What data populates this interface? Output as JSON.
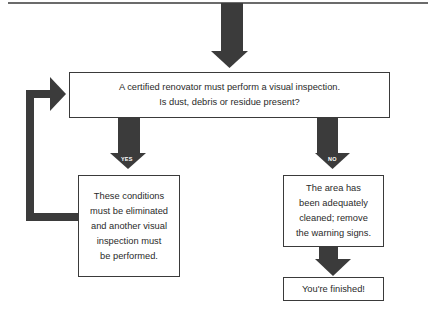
{
  "diagram": {
    "type": "flowchart",
    "colors": {
      "arrow": "#3b3b3b",
      "border": "#3a3a3a",
      "text": "#2a2a2a",
      "background": "#ffffff"
    },
    "nodes": {
      "inspection": {
        "line1": "A certified renovator must perform a visual inspection.",
        "line2": "Is dust, debris or residue present?"
      },
      "yes_result": {
        "lines": [
          "These conditions",
          "must be eliminated",
          "and another visual",
          "inspection must",
          "be performed."
        ]
      },
      "no_result": {
        "lines": [
          "The area has",
          "been adequately",
          "cleaned; remove",
          "the warning signs."
        ]
      },
      "finished": {
        "text": "You're finished!"
      }
    },
    "edges": {
      "yes_label": "YES",
      "no_label": "NO"
    }
  }
}
